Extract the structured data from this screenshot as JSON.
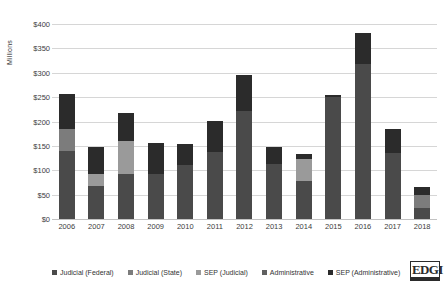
{
  "chart_data": {
    "type": "bar",
    "stacked": true,
    "title": "",
    "subtitle": "",
    "xlabel": "",
    "ylabel": "Millions",
    "ylim": [
      0,
      400
    ],
    "ytick_step": 50,
    "ytick_labels": [
      "$400",
      "$350",
      "$300",
      "$250",
      "$200",
      "$150",
      "$100",
      "$50",
      "$0"
    ],
    "grid": true,
    "legend_position": "bottom",
    "categories": [
      "2006",
      "2007",
      "2008",
      "2009",
      "2010",
      "2011",
      "2012",
      "2013",
      "2014",
      "2015",
      "2016",
      "2017",
      "2018"
    ],
    "series": [
      {
        "name": "Judicial (Federal)",
        "color": "#4a4a4a",
        "values": [
          140,
          68,
          92,
          92,
          110,
          138,
          222,
          112,
          78,
          250,
          317,
          135,
          22
        ]
      },
      {
        "name": "Judicial (State)",
        "color": "#7c7c7c",
        "values": [
          45,
          0,
          0,
          0,
          0,
          0,
          0,
          0,
          0,
          0,
          0,
          0,
          28
        ]
      },
      {
        "name": "SEP (Judicial)",
        "color": "#9a9a9a",
        "values": [
          0,
          25,
          68,
          0,
          0,
          0,
          0,
          0,
          45,
          0,
          0,
          0,
          0
        ]
      },
      {
        "name": "Administrative",
        "color": "#606060",
        "values": [
          0,
          0,
          0,
          0,
          0,
          0,
          0,
          0,
          0,
          0,
          0,
          0,
          0
        ]
      },
      {
        "name": "SEP (Administrative)",
        "color": "#2b2b2b",
        "values": [
          72,
          54,
          57,
          63,
          43,
          64,
          74,
          36,
          10,
          5,
          65,
          50,
          15
        ]
      }
    ],
    "totals": [
      257,
      147,
      217,
      155,
      153,
      202,
      296,
      148,
      133,
      255,
      382,
      185,
      65
    ]
  },
  "legend": {
    "items": [
      {
        "label": "Judicial (Federal)",
        "color": "#4a4a4a"
      },
      {
        "label": "Judicial (State)",
        "color": "#7c7c7c"
      },
      {
        "label": "SEP (Judicial)",
        "color": "#9a9a9a"
      },
      {
        "label": "Administrative",
        "color": "#606060"
      },
      {
        "label": "SEP (Administrative)",
        "color": "#2b2b2b"
      }
    ]
  },
  "branding": {
    "logo_text": "EDGI"
  }
}
